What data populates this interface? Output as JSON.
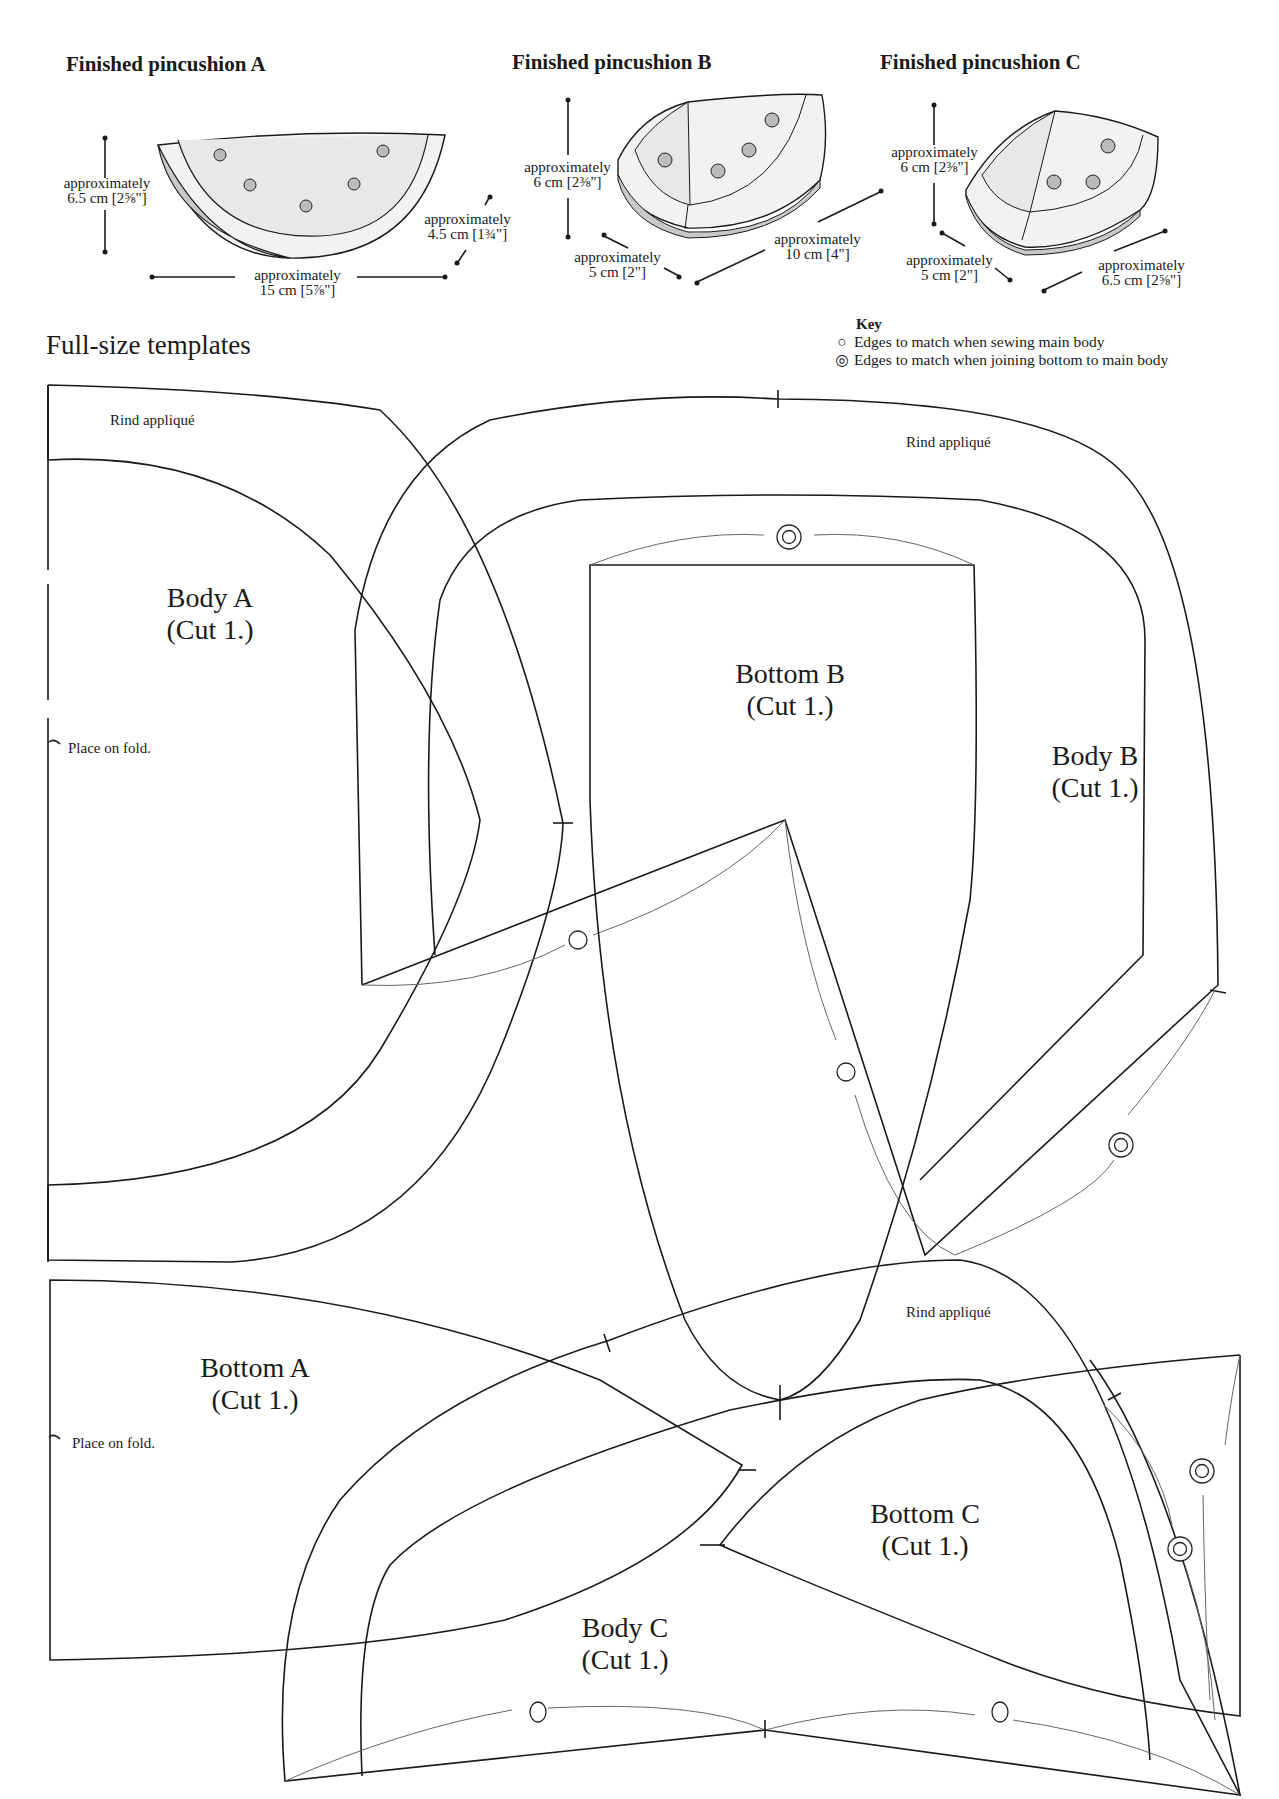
{
  "finished": [
    {
      "title": "Finished pincushion A",
      "dims": [
        {
          "label": "approximately",
          "value": "6.5 cm [2⅝\"]"
        },
        {
          "label": "approximately",
          "value": "4.5 cm [1¾\"]"
        },
        {
          "label": "approximately",
          "value": "15 cm [5⅞\"]"
        }
      ]
    },
    {
      "title": "Finished pincushion B",
      "dims": [
        {
          "label": "approximately",
          "value": "6 cm [2⅜\"]"
        },
        {
          "label": "approximately",
          "value": "5 cm [2\"]"
        },
        {
          "label": "approximately",
          "value": "10 cm [4\"]"
        }
      ]
    },
    {
      "title": "Finished pincushion C",
      "dims": [
        {
          "label": "approximately",
          "value": "6 cm [2⅜\"]"
        },
        {
          "label": "approximately",
          "value": "5 cm [2\"]"
        },
        {
          "label": "approximately",
          "value": "6.5 cm [2⅝\"]"
        }
      ]
    }
  ],
  "section_title": "Full-size templates",
  "key": {
    "title": "Key",
    "items": [
      {
        "icon": "circle-icon",
        "symbol": "○",
        "label": "Edges to match when sewing main body"
      },
      {
        "icon": "double-circle-icon",
        "symbol": "◎",
        "label": "Edges to match when joining bottom to main body"
      }
    ]
  },
  "templates": {
    "rind_label": "Rind appliqué",
    "fold_label": "Place on fold.",
    "cut": "(Cut 1.)",
    "pieces": [
      "Body A",
      "Bottom B",
      "Body B",
      "Bottom A",
      "Bottom C",
      "Body C"
    ]
  }
}
